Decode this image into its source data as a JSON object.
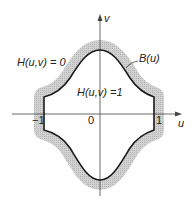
{
  "diagram": {
    "axes": {
      "u_label": "u",
      "v_label": "v",
      "origin_label": "0",
      "tick_neg1": "−1",
      "tick_pos1": "1"
    },
    "regions": {
      "outside_label": "H(u,v) = 0",
      "inside_label": "H(u,v) =1",
      "boundary_label": "B(u)"
    },
    "colors": {
      "curve": "#1a1a1a",
      "band": "#c8c8c8",
      "axis": "#444444"
    }
  }
}
